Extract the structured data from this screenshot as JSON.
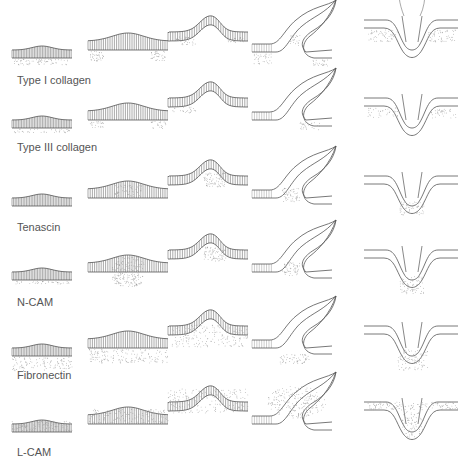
{
  "figure": {
    "stages": [
      "placode-early",
      "placode-late",
      "short-bud",
      "long-bud",
      "follicle"
    ],
    "rows": [
      {
        "label": "Type I collagen",
        "y": 0,
        "label_y": 80,
        "dermis": "lateral",
        "epithelium": "plain"
      },
      {
        "label": "Type III collagen",
        "y": 70,
        "label_y": 147,
        "dermis": "lateral-light",
        "epithelium": "plain"
      },
      {
        "label": "Tenascin",
        "y": 148,
        "label_y": 227,
        "dermis": "condensation-only",
        "epithelium": "plain"
      },
      {
        "label": "N-CAM",
        "y": 222,
        "label_y": 302,
        "dermis": "condensation-dense",
        "epithelium": "plain"
      },
      {
        "label": "Fibronectin",
        "y": 298,
        "label_y": 375,
        "dermis": "uniform",
        "epithelium": "plain"
      },
      {
        "label": "L-CAM",
        "y": 374,
        "label_y": 452,
        "dermis": "none",
        "epithelium": "stippled"
      }
    ],
    "colors": {
      "line": "#555555",
      "stipple": "#9a9a9a",
      "label": "#555555"
    }
  }
}
